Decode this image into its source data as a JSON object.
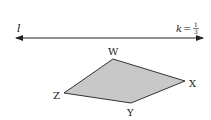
{
  "line": {
    "name": "l",
    "arrows": "both"
  },
  "scale_factor": {
    "variable": "k",
    "equals": "=",
    "numerator": "1",
    "denominator": "3"
  },
  "quadrilateral": {
    "vertices": [
      {
        "label": "W"
      },
      {
        "label": "X"
      },
      {
        "label": "Y"
      },
      {
        "label": "Z"
      }
    ],
    "fill_color": "#c8c8c8",
    "stroke_color": "#333333"
  }
}
